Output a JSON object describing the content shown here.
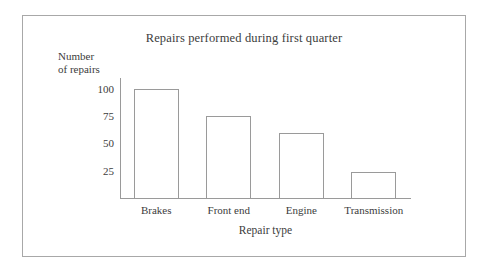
{
  "figure": {
    "frame_border_color": "#a8a8a8",
    "background_color": "#ffffff",
    "line_color": "#9a9a9a",
    "text_color": "#3c3c3c"
  },
  "chart_data": {
    "type": "bar",
    "title": "Repairs performed during first quarter",
    "xlabel": "Repair type",
    "ylabel": "Number of repairs",
    "ylabel_lines": [
      "Number",
      "of repairs"
    ],
    "categories": [
      "Brakes",
      "Front end",
      "Engine",
      "Transmission"
    ],
    "values": [
      100,
      75,
      60,
      24
    ],
    "yticks": [
      25,
      50,
      75,
      100
    ],
    "ytick_labels": [
      "25",
      "50",
      "75",
      "100"
    ],
    "ylim": [
      0,
      110
    ],
    "xlim": [
      0,
      4
    ],
    "grid": false,
    "legend": null,
    "bar_style": "outline",
    "bar_fill": "#ffffff",
    "bar_edge": "#9a9a9a",
    "series": [
      {
        "name": "Number of repairs",
        "values": [
          100,
          75,
          60,
          24
        ]
      }
    ]
  }
}
